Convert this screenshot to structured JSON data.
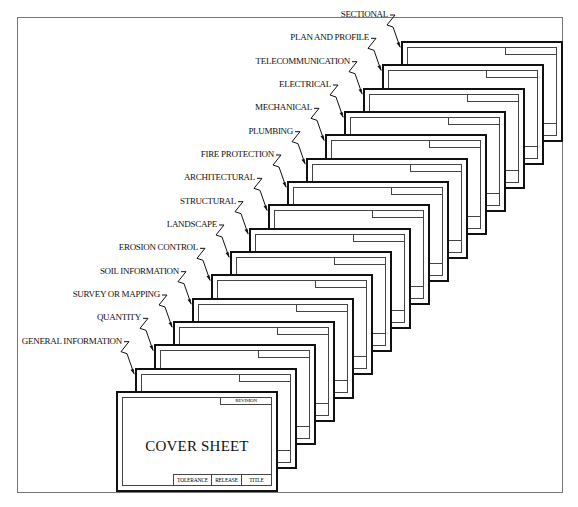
{
  "diagram": {
    "type": "stacked-drawing-sheet-order",
    "cover": {
      "title": "COVER SHEET",
      "revision_label": "REVISION",
      "title_block": [
        "TOLERANCE",
        "RELEASE",
        "TITLE"
      ]
    },
    "sheets": [
      {
        "label": "GENERAL INFORMATION"
      },
      {
        "label": "QUANTITY"
      },
      {
        "label": "SURVEY OR MAPPING"
      },
      {
        "label": "SOIL INFORMATION"
      },
      {
        "label": "EROSION CONTROL"
      },
      {
        "label": "LANDSCAPE"
      },
      {
        "label": "STRUCTURAL"
      },
      {
        "label": "ARCHITECTURAL"
      },
      {
        "label": "FIRE PROTECTION"
      },
      {
        "label": "PLUMBING"
      },
      {
        "label": "MECHANICAL"
      },
      {
        "label": "ELECTRICAL"
      },
      {
        "label": "TELECOMMUNICATION"
      },
      {
        "label": "PLAN AND PROFILE"
      },
      {
        "label": "SECTIONAL"
      }
    ]
  }
}
